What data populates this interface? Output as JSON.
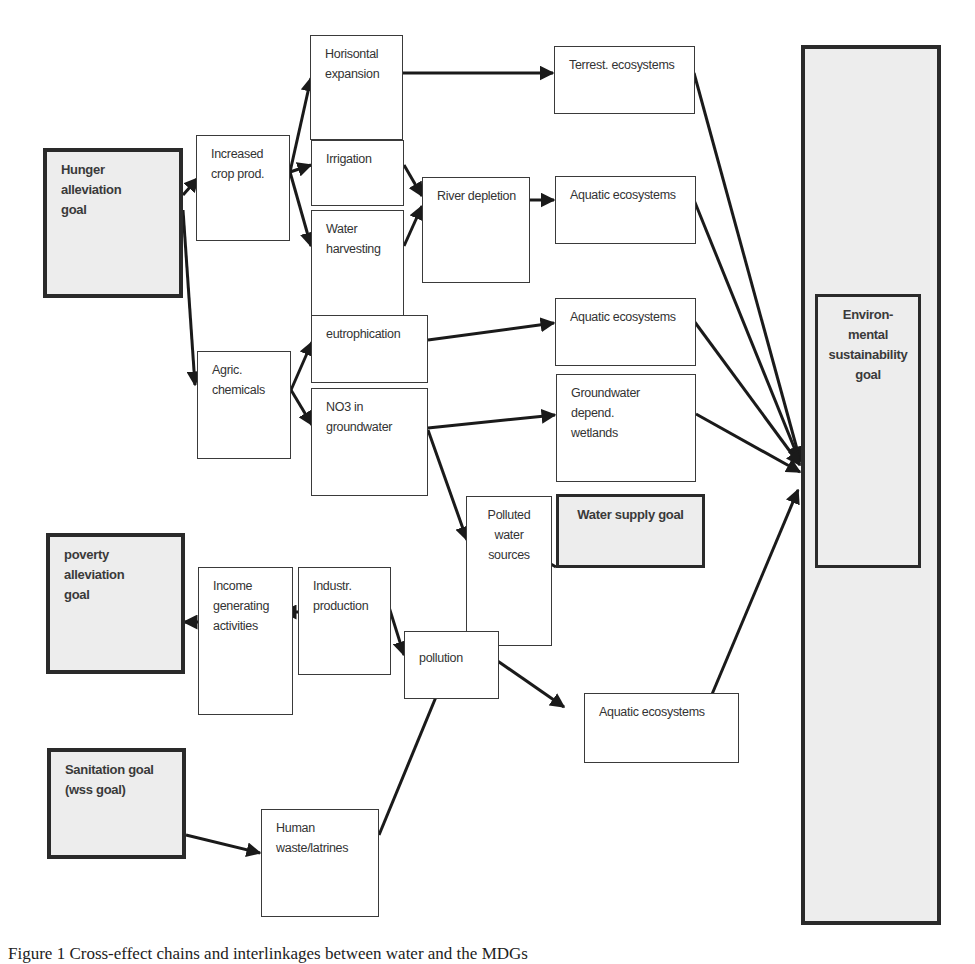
{
  "nodes": {
    "hunger_goal": "Hunger\nalleviation\ngoal",
    "increased_crop": "Increased\ncrop prod.",
    "horizontal_expansion": "Horisontal\nexpansion",
    "irrigation": "Irrigation",
    "water_harvesting": "Water\nharvesting",
    "river_depletion": "River depletion",
    "terrest_ecosystems": "Terrest. ecosystems",
    "aquatic_ecosystems_1": "Aquatic ecosystems",
    "agric_chemicals": "Agric.\nchemicals",
    "eutrophication": "eutrophication",
    "no3_groundwater": "NO3 in\ngroundwater",
    "aquatic_ecosystems_2": "Aquatic ecosystems",
    "groundwater_wetlands": "Groundwater depend.\nwetlands",
    "polluted_water": "Polluted\nwater\nsources",
    "water_supply_goal": "Water supply goal",
    "poverty_goal": "poverty\nalleviation\ngoal",
    "income_generating": "Income\ngenerating\nactivities",
    "industr_production": "Industr.\nproduction",
    "pollution": "pollution",
    "aquatic_ecosystems_3": "Aquatic ecosystems",
    "sanitation_goal": "Sanitation goal\n(wss goal)",
    "human_waste": "Human\nwaste/latrines",
    "env_goal": "Environ-\nmental\nsustainability\ngoal"
  },
  "edges": [
    {
      "from": "hunger_goal",
      "to": "increased_crop"
    },
    {
      "from": "hunger_goal",
      "to": "agric_chemicals"
    },
    {
      "from": "increased_crop",
      "to": "horizontal_expansion"
    },
    {
      "from": "increased_crop",
      "to": "irrigation"
    },
    {
      "from": "increased_crop",
      "to": "water_harvesting"
    },
    {
      "from": "horizontal_expansion",
      "to": "terrest_ecosystems"
    },
    {
      "from": "irrigation",
      "to": "river_depletion"
    },
    {
      "from": "water_harvesting",
      "to": "river_depletion"
    },
    {
      "from": "river_depletion",
      "to": "aquatic_ecosystems_1"
    },
    {
      "from": "agric_chemicals",
      "to": "eutrophication"
    },
    {
      "from": "agric_chemicals",
      "to": "no3_groundwater"
    },
    {
      "from": "eutrophication",
      "to": "aquatic_ecosystems_2"
    },
    {
      "from": "no3_groundwater",
      "to": "groundwater_wetlands"
    },
    {
      "from": "no3_groundwater",
      "to": "polluted_water"
    },
    {
      "from": "water_supply_goal",
      "to": "polluted_water"
    },
    {
      "from": "industr_production",
      "to": "income_generating"
    },
    {
      "from": "income_generating",
      "to": "poverty_goal"
    },
    {
      "from": "industr_production",
      "to": "pollution"
    },
    {
      "from": "pollution",
      "to": "polluted_water"
    },
    {
      "from": "pollution",
      "to": "aquatic_ecosystems_3"
    },
    {
      "from": "sanitation_goal",
      "to": "human_waste"
    },
    {
      "from": "human_waste",
      "to": "pollution"
    },
    {
      "from": "terrest_ecosystems",
      "to": "env_goal"
    },
    {
      "from": "aquatic_ecosystems_1",
      "to": "env_goal"
    },
    {
      "from": "aquatic_ecosystems_2",
      "to": "env_goal"
    },
    {
      "from": "groundwater_wetlands",
      "to": "env_goal"
    },
    {
      "from": "aquatic_ecosystems_3",
      "to": "env_goal"
    }
  ],
  "caption": "Figure 1    Cross-effect chains and interlinkages between water and the MDGs"
}
